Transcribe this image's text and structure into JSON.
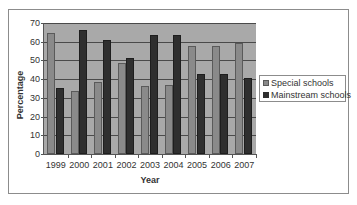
{
  "chart_data": {
    "type": "bar",
    "title": "",
    "xlabel": "Year",
    "ylabel": "Percentage",
    "ylim": [
      0,
      70
    ],
    "yticks": [
      0,
      10,
      20,
      30,
      40,
      50,
      60,
      70
    ],
    "grid": true,
    "legend_position": "right",
    "categories": [
      "1999",
      "2000",
      "2001",
      "2002",
      "2003",
      "2004",
      "2005",
      "2006",
      "2007"
    ],
    "series": [
      {
        "name": "Special schools",
        "color": "#8a8a8a",
        "values": [
          64.5,
          33.5,
          38.5,
          48.5,
          36.5,
          37,
          57.5,
          57.5,
          59.5
        ]
      },
      {
        "name": "Mainstream schools",
        "color": "#2f2f2f",
        "values": [
          35.5,
          66.5,
          61,
          51.5,
          63.5,
          63.5,
          42.5,
          42.5,
          40.5
        ]
      }
    ]
  }
}
